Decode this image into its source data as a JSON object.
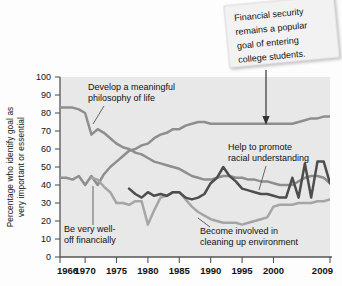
{
  "chart_data": {
    "type": "line",
    "title": "",
    "xlabel": "",
    "ylabel": "Percentage who identify goal as very important or essential",
    "xlim": [
      1966,
      2009
    ],
    "ylim": [
      0,
      100
    ],
    "grid": false,
    "legend_position": "inline-annotations",
    "ytick_labels": [
      "0",
      "10",
      "20",
      "30",
      "40",
      "50",
      "60",
      "70",
      "80",
      "90",
      "100"
    ],
    "ytick_values": [
      0,
      10,
      20,
      30,
      40,
      50,
      60,
      70,
      80,
      90,
      100
    ],
    "xtick_labels": [
      "1966",
      "1970",
      "1975",
      "1980",
      "1985",
      "1990",
      "1995",
      "2000",
      "2009"
    ],
    "xtick_values": [
      1966,
      1970,
      1975,
      1980,
      1985,
      1990,
      1995,
      2000,
      2009
    ],
    "series": [
      {
        "name": "Develop a meaningful philosophy of life",
        "color": "#8e8e8e",
        "x": [
          1966,
          1967,
          1968,
          1969,
          1970,
          1971,
          1972,
          1973,
          1974,
          1975,
          1976,
          1977,
          1978,
          1979,
          1980,
          1981,
          1982,
          1983,
          1984,
          1985,
          1986,
          1987,
          1988,
          1989,
          1990,
          1991,
          1992,
          1993,
          1994,
          1995,
          1996,
          1997,
          1998,
          1999,
          2000,
          2001,
          2002,
          2003,
          2004,
          2005,
          2006,
          2007,
          2008,
          2009
        ],
        "values": [
          83,
          83,
          83,
          82,
          80,
          68,
          71,
          69,
          66,
          63,
          61,
          60,
          58,
          57,
          55,
          53,
          52,
          51,
          50,
          49,
          47,
          45,
          44,
          43,
          43,
          44,
          45,
          45,
          44,
          44,
          43,
          43,
          42,
          42,
          41,
          40,
          40,
          40,
          42,
          44,
          45,
          45,
          44,
          41
        ]
      },
      {
        "name": "Be very well-off financially",
        "color": "#8e8e8e",
        "x": [
          1966,
          1967,
          1968,
          1969,
          1970,
          1971,
          1972,
          1973,
          1974,
          1975,
          1976,
          1977,
          1978,
          1979,
          1980,
          1981,
          1982,
          1983,
          1984,
          1985,
          1986,
          1987,
          1988,
          1989,
          1990,
          1991,
          1992,
          1993,
          1994,
          1995,
          1996,
          1997,
          1998,
          1999,
          2000,
          2001,
          2002,
          2003,
          2004,
          2005,
          2006,
          2007,
          2008,
          2009
        ],
        "values": [
          44,
          44,
          43,
          45,
          40,
          45,
          40,
          46,
          50,
          53,
          56,
          59,
          60,
          62,
          63,
          66,
          68,
          69,
          71,
          71,
          73,
          74,
          75,
          75,
          74,
          74,
          74,
          74,
          74,
          74,
          74,
          74,
          74,
          74,
          74,
          74,
          74,
          74,
          75,
          76,
          77,
          77,
          78,
          78
        ]
      },
      {
        "name": "Help to promote racial understanding",
        "color": "#4d4d4d",
        "x": [
          1977,
          1978,
          1979,
          1980,
          1981,
          1982,
          1983,
          1984,
          1985,
          1986,
          1987,
          1988,
          1989,
          1990,
          1991,
          1992,
          1993,
          1994,
          1995,
          1996,
          1997,
          1998,
          1999,
          2000,
          2001,
          2002,
          2003,
          2004,
          2005,
          2006,
          2007,
          2008,
          2009
        ],
        "values": [
          38,
          35,
          33,
          36,
          34,
          35,
          34,
          36,
          36,
          33,
          32,
          33,
          35,
          41,
          44,
          50,
          45,
          42,
          38,
          37,
          36,
          35,
          35,
          34,
          33,
          33,
          44,
          33,
          52,
          33,
          53,
          53,
          41
        ]
      },
      {
        "name": "Become involved in cleaning up environment",
        "color": "#a5a5a5",
        "x": [
          1971,
          1972,
          1973,
          1974,
          1975,
          1976,
          1977,
          1978,
          1979,
          1980,
          1981,
          1982,
          1983,
          1984,
          1985,
          1986,
          1987,
          1988,
          1989,
          1990,
          1991,
          1992,
          1993,
          1994,
          1995,
          1996,
          1997,
          1998,
          1999,
          2000,
          2001,
          2002,
          2003,
          2004,
          2005,
          2006,
          2007,
          2008,
          2009
        ],
        "values": [
          44,
          43,
          39,
          36,
          30,
          30,
          29,
          31,
          31,
          18,
          26,
          33,
          34,
          36,
          36,
          32,
          28,
          25,
          23,
          21,
          20,
          19,
          19,
          19,
          18,
          19,
          20,
          21,
          22,
          28,
          29,
          29,
          29,
          30,
          30,
          30,
          31,
          31,
          32
        ]
      }
    ],
    "annotations": [
      {
        "id": "philosophy",
        "text_lines": [
          "Develop a meaningful",
          "philosophy of life"
        ]
      },
      {
        "id": "financial",
        "text_lines": [
          "Be very well-",
          "off financially"
        ]
      },
      {
        "id": "racial",
        "text_lines": [
          "Help to promote",
          "racial understanding"
        ]
      },
      {
        "id": "environment",
        "text_lines": [
          "Become involved in",
          "cleaning up environment"
        ]
      }
    ],
    "callout": {
      "lines": [
        "Financial security",
        "remains a popular",
        "goal of entering",
        "college students."
      ]
    }
  },
  "colors": {
    "plot_background": "#e8e8e8",
    "axis": "#555555",
    "text": "#111111",
    "callout_background": "#f2f2f2"
  }
}
